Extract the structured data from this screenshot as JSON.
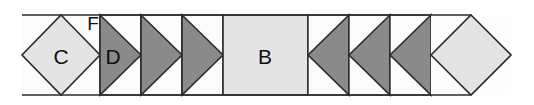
{
  "figure": {
    "type": "chevron-strip-diagram",
    "background_color": "#ffffff",
    "stroke_color": "#2b2b2b",
    "colors": {
      "light_fill": "#e4e4e4",
      "dark_fill": "#8a8a8a",
      "white_fill": "#fcfcfc",
      "outline": "#2b2b2b"
    },
    "band": {
      "left": 22,
      "right": 511,
      "top": 15,
      "bottom": 95
    },
    "cells": [
      {
        "id": "cell-c",
        "shape": "diamond",
        "label": "C",
        "fill": "light",
        "x": 22,
        "width": 78,
        "label_x": 61,
        "label_y": 58
      },
      {
        "id": "cell-d",
        "shape": "triangle-right",
        "label": "D",
        "fill": "dark",
        "x": 100,
        "width": 41,
        "label_x": 113,
        "label_y": 58
      },
      {
        "id": "cell-3",
        "shape": "triangle-right",
        "label": "",
        "fill": "dark",
        "x": 141,
        "width": 41,
        "label_x": 154,
        "label_y": 58
      },
      {
        "id": "cell-4",
        "shape": "triangle-right",
        "label": "",
        "fill": "dark",
        "x": 182,
        "width": 41,
        "label_x": 195,
        "label_y": 58
      },
      {
        "id": "cell-b",
        "shape": "square",
        "label": "B",
        "fill": "light",
        "x": 223,
        "width": 85,
        "label_x": 265,
        "label_y": 58
      },
      {
        "id": "cell-6",
        "shape": "triangle-left",
        "label": "",
        "fill": "dark",
        "x": 308,
        "width": 41,
        "label_x": 336,
        "label_y": 58
      },
      {
        "id": "cell-7",
        "shape": "triangle-left",
        "label": "",
        "fill": "dark",
        "x": 349,
        "width": 41,
        "label_x": 377,
        "label_y": 58
      },
      {
        "id": "cell-8",
        "shape": "triangle-left",
        "label": "",
        "fill": "dark",
        "x": 390,
        "width": 41,
        "label_x": 418,
        "label_y": 58
      },
      {
        "id": "cell-end",
        "shape": "diamond",
        "label": "",
        "fill": "light",
        "x": 431,
        "width": 80,
        "label_x": 471,
        "label_y": 58
      }
    ],
    "annotations": [
      {
        "id": "label-f",
        "text": "F",
        "x": 93,
        "y": 25
      }
    ]
  }
}
